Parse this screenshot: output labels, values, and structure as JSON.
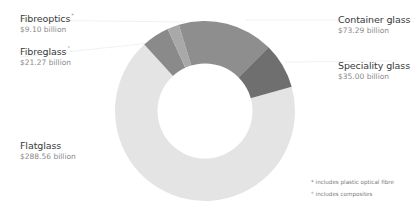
{
  "chart_data": {
    "type": "pie",
    "variant": "donut",
    "title": "",
    "unit": "billion USD",
    "categories": [
      "Flatglass",
      "Container glass",
      "Speciality glass",
      "Fibreglass",
      "Fibreoptics"
    ],
    "values": [
      288.56,
      73.29,
      35.0,
      21.27,
      9.1
    ],
    "value_labels": [
      "$288.56 billion",
      "$73.29 billion",
      "$35.00 billion",
      "$21.27 billion",
      "$9.10 billion"
    ],
    "colors": [
      "#e4e4e4",
      "#8e8e8e",
      "#6f6f6f",
      "#8a8a8a",
      "#a9a9a9"
    ],
    "legend_position": "labels-around",
    "annotations": [
      "* includes plastic optical fibre",
      "° includes composites"
    ]
  },
  "labels": {
    "fibreoptics": {
      "name": "Fibreoptics",
      "marker": "*",
      "value": "$9.10 billion"
    },
    "fibreglass": {
      "name": "Fibreglass",
      "marker": "°",
      "value": "$21.27 billion"
    },
    "flatglass": {
      "name": "Flatglass",
      "value": "$288.56 billion"
    },
    "container": {
      "name": "Container glass",
      "value": "$73.29 billion"
    },
    "speciality": {
      "name": "Speciality glass",
      "value": "$35.00 billion"
    }
  },
  "footnotes": {
    "fibre": "* includes plastic optical fibre",
    "composites": "° includes composites"
  }
}
